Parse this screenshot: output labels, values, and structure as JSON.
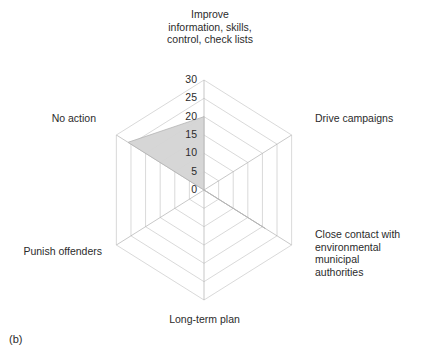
{
  "figure": {
    "caption": "(b)"
  },
  "chart_data": {
    "type": "radar",
    "title": "",
    "subtitle": "",
    "xlabel": "",
    "ylabel": "",
    "grid": true,
    "grid_shape": "hexagon",
    "legend": "none",
    "rlim": [
      0,
      30
    ],
    "tick_values": [
      0,
      5,
      10,
      15,
      20,
      25,
      30
    ],
    "tick_labels": [
      "0",
      "5",
      "10",
      "15",
      "20",
      "25",
      "30"
    ],
    "tick_axis": "top",
    "categories": [
      "Improve\ninformation, skills,\ncontrol, check lists",
      "Drive campaigns",
      "Close contact with\nenvironmental\nmunicipal\nauthorities",
      "Long-term plan",
      "Punish offenders",
      "No action"
    ],
    "categories_flat": [
      "Improve information, skills, control, check lists",
      "Drive campaigns",
      "Close contact with environmental municipal authorities",
      "Long-term plan",
      "Punish offenders",
      "No action"
    ],
    "series": [
      {
        "name": "Responses",
        "values": [
          20,
          0,
          21,
          0,
          0,
          26
        ]
      }
    ],
    "fill_color": "#d4d4d4",
    "line_color": "#b4b4b4",
    "grid_color": "#c8c8c8",
    "axis_color": "#b0b0b0",
    "background": "#ffffff"
  },
  "labels": {
    "top": "Improve\ninformation, skills,\ncontrol, check lists",
    "right_top": "Drive campaigns",
    "right_bottom": "Close contact with\nenvironmental\nmunicipal\nauthorities",
    "bottom": "Long-term plan",
    "left_bottom": "Punish offenders",
    "left_top": "No action"
  },
  "ticks": {
    "t0": "0",
    "t5": "5",
    "t10": "10",
    "t15": "15",
    "t20": "20",
    "t25": "25",
    "t30": "30"
  }
}
